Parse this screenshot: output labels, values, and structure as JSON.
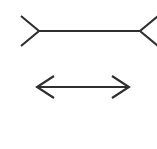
{
  "figure": {
    "name": "muller-lyer-illusion",
    "title": "Müller-Lyer illusion",
    "background_color": "#ffffff",
    "stroke_color": "#2f2f2f",
    "stroke_width": 2.1,
    "canvas": {
      "width": 157,
      "height": 149
    },
    "shapes": [
      {
        "id": "top-figure",
        "label": "outward-fins-line",
        "description": "Horizontal line with outward pointing fins (arrow tails)",
        "shaft": {
          "x1": 39,
          "y1": 31,
          "x2": 140,
          "y2": 31
        },
        "left_fin": {
          "points": "21,16 39,31 21,46"
        },
        "right_fin": {
          "points": "158,16 140,31 158,46"
        }
      },
      {
        "id": "bottom-figure",
        "label": "inward-arrowheads-line",
        "description": "Horizontal line with inward pointing arrowheads",
        "shaft": {
          "x1": 37,
          "y1": 87,
          "x2": 129,
          "y2": 87
        },
        "left_head": {
          "points": "54,76 37,87 54,98"
        },
        "right_head": {
          "points": "112,76 129,87 112,98"
        }
      }
    ]
  }
}
